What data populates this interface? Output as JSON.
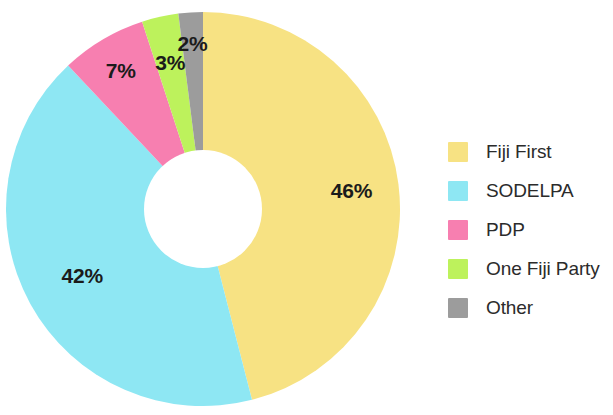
{
  "chart_data": {
    "type": "pie",
    "variant": "donut",
    "title": "",
    "subtitle": "",
    "xlabel": "",
    "ylabel": "",
    "grid": false,
    "legend_position": "right",
    "start_angle_deg": 0,
    "direction": "clockwise",
    "units": "percent",
    "categories": [
      "Fiji First",
      "SODELPA",
      "PDP",
      "One Fiji Party",
      "Other"
    ],
    "values": [
      46,
      42,
      7,
      3,
      2
    ],
    "data_labels": [
      "46%",
      "42%",
      "7%",
      "3%",
      "2%"
    ],
    "colors": [
      "#F7E283",
      "#8EE7F3",
      "#F77FB0",
      "#BDF25C",
      "#9C9C9C"
    ],
    "slices": [
      {
        "label": "Fiji First",
        "value": 46,
        "data_label": "46%",
        "color": "#F7E283"
      },
      {
        "label": "SODELPA",
        "value": 42,
        "data_label": "42%",
        "color": "#8EE7F3"
      },
      {
        "label": "PDP",
        "value": 7,
        "data_label": "7%",
        "color": "#F77FB0"
      },
      {
        "label": "One Fiji Party",
        "value": 3,
        "data_label": "3%",
        "color": "#BDF25C"
      },
      {
        "label": "Other",
        "value": 2,
        "data_label": "2%",
        "color": "#9C9C9C"
      }
    ]
  },
  "legend": {
    "items": [
      {
        "label": "Fiji First",
        "color": "#F7E283"
      },
      {
        "label": "SODELPA",
        "color": "#8EE7F3"
      },
      {
        "label": "PDP",
        "color": "#F77FB0"
      },
      {
        "label": "One Fiji Party",
        "color": "#BDF25C"
      },
      {
        "label": "Other",
        "color": "#9C9C9C"
      }
    ]
  },
  "labels": {
    "fiji_first": "46%",
    "sodelpa": "42%",
    "pdp": "7%",
    "one_fiji_party": "3%",
    "other": "2%"
  }
}
